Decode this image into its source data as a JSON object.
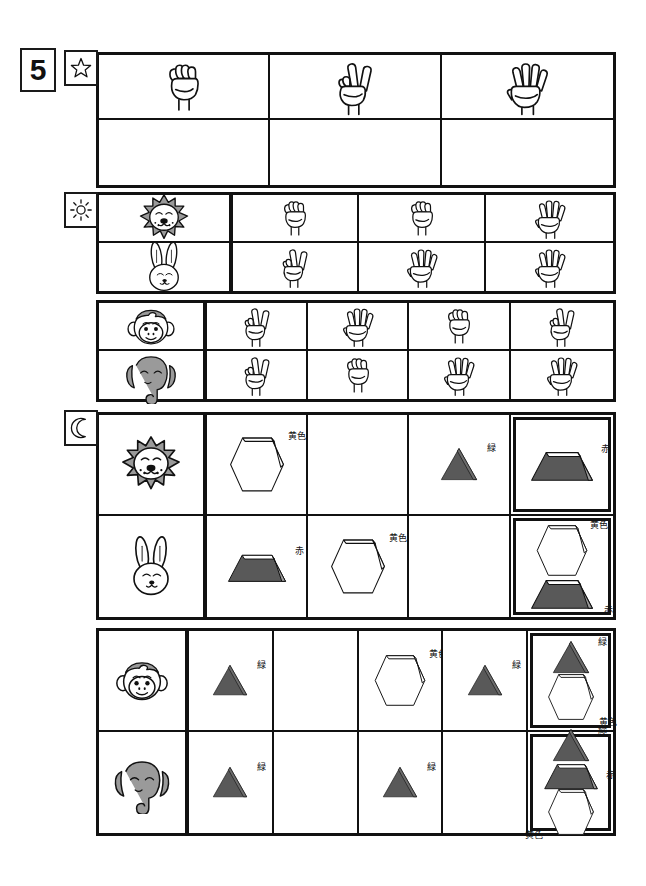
{
  "page": {
    "number": "5",
    "width": 646,
    "height": 886
  },
  "markers": {
    "star": "star-icon",
    "sun": "sun-icon",
    "moon": "moon-icon"
  },
  "legend": {
    "colors": {
      "yellow": "黄色",
      "red": "赤",
      "green": "緑"
    },
    "hex": {
      "shape_fill_dark": "#595959",
      "shape_fill_light": "#ffffff",
      "animal_gray": "#9a9a9a",
      "line": "#111111"
    }
  },
  "section_star": {
    "marker": "star-icon",
    "header_row": [
      {
        "hand": "fist",
        "count": 0
      },
      {
        "hand": "peace",
        "count": 2
      },
      {
        "hand": "open",
        "count": 5
      }
    ],
    "answer_row": [
      {
        "hand": "",
        "count": null
      },
      {
        "hand": "",
        "count": null
      },
      {
        "hand": "",
        "count": null
      }
    ]
  },
  "section_sun": {
    "marker": "sun-icon",
    "group_a": {
      "rows": [
        {
          "animal": "lion",
          "hands": [
            {
              "hand": "fist",
              "count": 0
            },
            {
              "hand": "fist",
              "count": 0
            },
            {
              "hand": "open",
              "count": 5
            }
          ]
        },
        {
          "animal": "rabbit",
          "hands": [
            {
              "hand": "peace",
              "count": 2
            },
            {
              "hand": "open",
              "count": 5
            },
            {
              "hand": "open",
              "count": 5
            }
          ]
        }
      ]
    },
    "group_b": {
      "rows": [
        {
          "animal": "monkey",
          "hands": [
            {
              "hand": "peace",
              "count": 2
            },
            {
              "hand": "open",
              "count": 5
            },
            {
              "hand": "fist",
              "count": 0
            },
            {
              "hand": "peace",
              "count": 2
            }
          ]
        },
        {
          "animal": "elephant",
          "hands": [
            {
              "hand": "peace",
              "count": 2
            },
            {
              "hand": "fist",
              "count": 0
            },
            {
              "hand": "open",
              "count": 5
            },
            {
              "hand": "open",
              "count": 5
            }
          ]
        }
      ]
    }
  },
  "section_moon": {
    "marker": "moon-icon",
    "group_a": {
      "rows": [
        {
          "animal": "lion",
          "cells": [
            {
              "shape": "hexagon",
              "fill": "light",
              "label": "黄色"
            },
            {
              "shape": "",
              "fill": "",
              "label": ""
            },
            {
              "shape": "triangle",
              "fill": "dark",
              "label": "緑"
            }
          ],
          "result": {
            "stack": [
              {
                "shape": "trapezoid",
                "fill": "dark",
                "label": "赤",
                "label_pos": "top-right"
              }
            ]
          }
        },
        {
          "animal": "rabbit",
          "cells": [
            {
              "shape": "trapezoid",
              "fill": "dark",
              "label": "赤"
            },
            {
              "shape": "hexagon",
              "fill": "light",
              "label": "黄色"
            },
            {
              "shape": "",
              "fill": "",
              "label": ""
            }
          ],
          "result": {
            "stack": [
              {
                "shape": "hexagon",
                "fill": "light",
                "label": "黄色",
                "label_pos": "top-right"
              },
              {
                "shape": "trapezoid",
                "fill": "dark",
                "label": "赤",
                "label_pos": "bottom-right"
              }
            ]
          }
        }
      ]
    },
    "group_b": {
      "rows": [
        {
          "animal": "monkey",
          "cells": [
            {
              "shape": "triangle",
              "fill": "dark",
              "label": "緑"
            },
            {
              "shape": "",
              "fill": "",
              "label": ""
            },
            {
              "shape": "hexagon",
              "fill": "light",
              "label": "黄色"
            },
            {
              "shape": "triangle",
              "fill": "dark",
              "label": "緑"
            }
          ],
          "result": {
            "stack": [
              {
                "shape": "triangle",
                "fill": "dark",
                "label": "緑",
                "label_pos": "top-right"
              },
              {
                "shape": "hexagon",
                "fill": "light",
                "label": "黄色",
                "label_pos": "bottom-right"
              }
            ]
          }
        },
        {
          "animal": "elephant",
          "cells": [
            {
              "shape": "triangle",
              "fill": "dark",
              "label": "緑"
            },
            {
              "shape": "",
              "fill": "",
              "label": ""
            },
            {
              "shape": "triangle",
              "fill": "dark",
              "label": "緑"
            },
            {
              "shape": "",
              "fill": "",
              "label": ""
            }
          ],
          "result": {
            "stack": [
              {
                "shape": "triangle",
                "fill": "dark",
                "label": "緑",
                "label_pos": "top-right"
              },
              {
                "shape": "trapezoid",
                "fill": "dark",
                "label": "赤",
                "label_pos": "mid-right"
              },
              {
                "shape": "hexagon",
                "fill": "light",
                "label": "黄色",
                "label_pos": "bottom-left"
              }
            ]
          }
        }
      ]
    }
  }
}
